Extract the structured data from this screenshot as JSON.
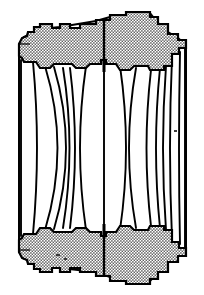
{
  "figure": {
    "title": "Lens cross-section diagram",
    "type": "optical-cross-section",
    "width": 204,
    "height": 295,
    "background_color": "#ffffff",
    "line_color": "#000000",
    "hatch_color": "#9a9a9a",
    "glass_fill": "#ffffff",
    "axis_label": "",
    "caption": ""
  },
  "barrel": {
    "name": "lens-barrel-housing",
    "fill_pattern": "stipple-checker",
    "fill_color": "#a8a8a8",
    "outline_width": 2,
    "upper": {
      "label": "upper barrel wall",
      "path": "M 20,39 L 22,36 L 26,36 L 28,33 L 34,33 L 34,27 L 40,27 L 40,24 L 52,24 L 52,28 L 60,28 L 60,24 L 70,24 L 70,28 L 80,28 L 80,24 L 96,24 L 96,20 L 110,20 L 110,15 L 126,15 L 126,12 L 150,12 L 150,16 L 158,16 L 158,24 L 168,24 L 168,34 L 178,34 L 178,40 L 186,40 L 186,48 L 180,48 L 180,56 L 172,56 L 172,68 L 164,68 L 164,72 L 150,72 L 148,68 L 134,68 L 130,72 L 118,72 L 114,66 L 106,66 L 106,62 L 100,62 L 100,66 L 92,66 L 88,72 L 76,72 L 72,66 L 54,66 L 50,72 L 40,72 L 36,64 L 24,64 L 22,60 L 18,60 L 18,44 Z"
    },
    "lower": {
      "label": "lower barrel wall",
      "path": "M 18,236 L 22,236 L 24,232 L 36,232 L 40,224 L 50,224 L 54,230 L 72,230 L 76,224 L 88,224 L 92,230 L 100,230 L 100,234 L 106,234 L 106,230 L 114,230 L 118,224 L 130,224 L 134,228 L 148,228 L 150,224 L 164,224 L 164,228 L 172,228 L 172,240 L 180,240 L 180,248 L 186,248 L 186,256 L 178,256 L 178,262 L 168,262 L 168,272 L 158,272 L 158,280 L 150,280 L 150,284 L 126,284 L 126,281 L 110,281 L 110,276 L 96,276 L 96,272 L 80,272 L 80,268 L 70,268 L 70,272 L 60,272 L 60,268 L 52,268 L 52,272 L 40,272 L 40,269 L 34,269 L 34,263 L 28,263 L 26,260 L 22,260 L 20,257 L 18,252 Z"
    }
  },
  "optical_axis": {
    "name": "optical-axis-divider",
    "x": 104,
    "top_y": 20,
    "bottom_y": 276,
    "visible": true
  },
  "aperture_stop": {
    "name": "aperture-stop",
    "x": 104,
    "upper_y": 62,
    "lower_y": 234,
    "label": "stop"
  },
  "lens_elements": [
    {
      "id": 1,
      "name": "element-1-front-meniscus",
      "group": "front",
      "front_x": 22,
      "rear_x": 33,
      "top_y": 62,
      "bottom_y": 234,
      "front_curve": 0,
      "rear_curve": 10
    },
    {
      "id": 2,
      "name": "element-2-front-meniscus",
      "group": "front",
      "front_x": 33,
      "rear_x": 47,
      "top_y": 66,
      "bottom_y": 230,
      "front_curve": 10,
      "rear_curve": 26
    },
    {
      "id": 3,
      "name": "element-3-cemented-doublet-a",
      "group": "front",
      "front_x": 47,
      "rear_x": 62,
      "top_y": 67,
      "bottom_y": 229,
      "front_curve": 26,
      "rear_curve": 18
    },
    {
      "id": 4,
      "name": "element-4-cemented-doublet-b",
      "group": "front",
      "front_x": 62,
      "rear_x": 70,
      "top_y": 68,
      "bottom_y": 228,
      "front_curve": 18,
      "rear_curve": 14
    },
    {
      "id": 5,
      "name": "element-5-biconvex-center",
      "group": "center",
      "front_x": 78,
      "rear_x": 104,
      "top_y": 66,
      "bottom_y": 230,
      "front_curve": 12,
      "rear_curve": 0
    },
    {
      "id": 6,
      "name": "element-6-biconvex-rear",
      "group": "rear",
      "front_x": 104,
      "rear_x": 136,
      "top_y": 68,
      "bottom_y": 228,
      "front_curve": 0,
      "rear_curve": 22
    },
    {
      "id": 7,
      "name": "element-7-meniscus-rear",
      "group": "rear",
      "front_x": 136,
      "rear_x": 152,
      "top_y": 70,
      "bottom_y": 226,
      "front_curve": 22,
      "rear_curve": 14
    },
    {
      "id": 8,
      "name": "element-8-thin-rear",
      "group": "rear",
      "front_x": 152,
      "rear_x": 162,
      "top_y": 68,
      "bottom_y": 228,
      "front_curve": 14,
      "rear_curve": 8
    },
    {
      "id": 9,
      "name": "element-9-rear-field",
      "group": "rear",
      "front_x": 162,
      "rear_x": 176,
      "top_y": 56,
      "bottom_y": 240,
      "front_curve": 8,
      "rear_curve": 2
    }
  ],
  "annotations": []
}
